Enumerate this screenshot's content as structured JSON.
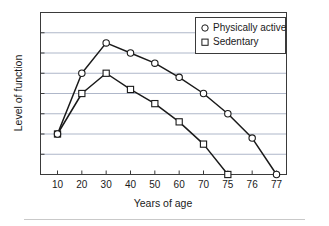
{
  "chart_data": {
    "type": "line",
    "title": "",
    "xlabel": "Years of age",
    "ylabel": "Level of function",
    "x": [
      10,
      20,
      30,
      40,
      50,
      60,
      70,
      75,
      76,
      77
    ],
    "xtick_labels": [
      "10",
      "20",
      "30",
      "40",
      "50",
      "60",
      "70",
      "75",
      "76",
      "77"
    ],
    "ylim": [
      0,
      8
    ],
    "ytick_labels": [],
    "grid": "horizontal",
    "gridline_count": 7,
    "legend_position": "top-right-inside",
    "series": [
      {
        "name": "Physically active",
        "marker": "circle-open",
        "x": [
          10,
          20,
          30,
          40,
          50,
          60,
          70,
          75,
          76,
          77
        ],
        "values": [
          2.0,
          5.0,
          6.5,
          6.0,
          5.5,
          4.8,
          4.0,
          3.0,
          1.8,
          0.0
        ]
      },
      {
        "name": "Sedentary",
        "marker": "square-open",
        "x": [
          10,
          20,
          30,
          40,
          50,
          60,
          70,
          75
        ],
        "values": [
          2.0,
          4.0,
          5.0,
          4.2,
          3.5,
          2.6,
          1.5,
          0.0
        ]
      }
    ]
  },
  "legend": {
    "entries": [
      {
        "label": "Physically active",
        "marker_name": "circle-marker-icon"
      },
      {
        "label": "Sedentary",
        "marker_name": "square-marker-icon"
      }
    ]
  },
  "axes": {
    "x_title": "Years of age",
    "y_title": "Level of function"
  },
  "colors": {
    "line": "#1a1a1a",
    "grid": "#9aa4bb",
    "frame": "#3a3a3a",
    "marker_fill": "#ffffff",
    "background": "#ffffff",
    "footer_rule": "#c9c9c9"
  }
}
